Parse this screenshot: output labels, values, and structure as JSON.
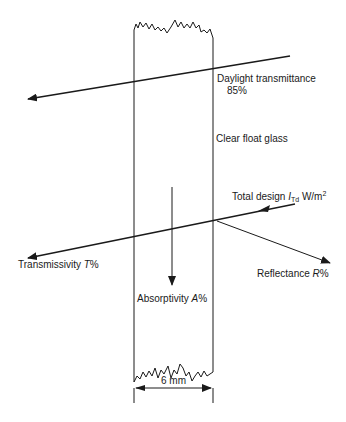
{
  "diagram": {
    "labels": {
      "daylight_line1": "Daylight transmittance",
      "daylight_line2": "85%",
      "glass": "Clear float glass",
      "total_design_prefix": "Total design ",
      "total_design_symbol": "I",
      "total_design_sub": "Td",
      "total_design_unit": " W/m",
      "total_design_sup": "2",
      "transmissivity_prefix": "Transmissivity ",
      "transmissivity_symbol": "T",
      "transmissivity_suffix": "%",
      "reflectance_prefix": "Reflectance ",
      "reflectance_symbol": "R",
      "reflectance_suffix": "%",
      "absorptivity_prefix": "Absorptivity ",
      "absorptivity_symbol": "A",
      "absorptivity_suffix": "%",
      "thickness": "6 mm"
    },
    "colors": {
      "line": "#1a1a1a",
      "background": "#ffffff"
    }
  }
}
